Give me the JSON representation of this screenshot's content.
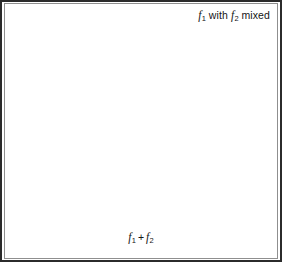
{
  "figure": {
    "background_color": "#ffffff",
    "frame_color": "#2b2b2b",
    "width": 282,
    "height": 262
  },
  "labels": {
    "top": {
      "full_text": "f1 with f2 mixed",
      "symbol_1": "f",
      "sub_1": "1",
      "middle_text": " with ",
      "symbol_2": "f",
      "sub_2": "2",
      "trailing_text": " mixed"
    },
    "bottom": {
      "full_text": "f1 + f2",
      "symbol_1": "f",
      "sub_1": "1",
      "operator": "+",
      "symbol_2": "f",
      "sub_2": "2"
    }
  },
  "chart_data": {
    "type": "line",
    "title": "",
    "xlabel": "",
    "ylabel": "",
    "grid": true,
    "legend_position": "none",
    "panels": [
      {
        "name": "top-panel",
        "annotation": "f1 with f2 mixed",
        "description": "Two superimposed high-frequency sinusoids of slightly different frequency drawn on the same axis; the thin grey trace is f1 and the heavier dark trace is f2.",
        "x_start": 12,
        "x_end": 272,
        "baseline_y": 70,
        "amplitude_px": 38,
        "gridlines_y": [
          44,
          86
        ],
        "series": [
          {
            "name": "f1",
            "style": "thin-grey",
            "color": "#7d7d7d",
            "cycles": 28.0,
            "phase_deg": 0,
            "amplitude_px": 37
          },
          {
            "name": "f2",
            "style": "thick-dark",
            "color": "#1a1a1a",
            "cycles": 26.0,
            "phase_deg": 12,
            "amplitude_px": 39
          }
        ]
      },
      {
        "name": "bottom-panel",
        "annotation": "f1 + f2",
        "description": "Sum of the two sinusoids showing beat / amplitude-modulation; the heavy dark curve is the slow beat envelope sinusoid and the thin grey curve is the summed high-frequency signal.",
        "x_start": 12,
        "x_end": 272,
        "baseline_y": 176,
        "amplitude_px": 43,
        "gridlines_y": [
          133,
          176,
          216
        ],
        "beat_nodes_x": [
          50,
          150,
          255
        ],
        "beat_antinodes_x": [
          12,
          105,
          205
        ],
        "series": [
          {
            "name": "f1 + f2 beat signal",
            "style": "thin-grey",
            "color": "#7d7d7d",
            "cycles": 27.0,
            "beat_cycles": 2.6,
            "amplitude_px": 45
          },
          {
            "name": "beat envelope (difference frequency)",
            "style": "thick-dark",
            "color": "#111111",
            "cycles": 1.52,
            "phase_deg": 90,
            "amplitude_px": 43
          }
        ]
      }
    ]
  }
}
